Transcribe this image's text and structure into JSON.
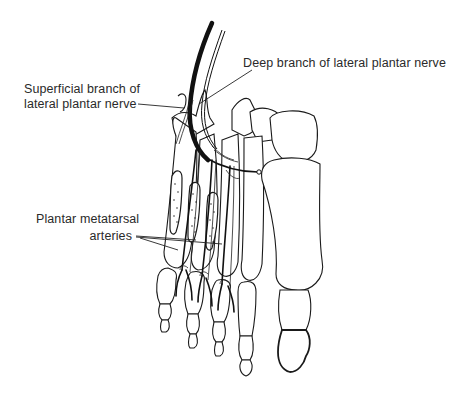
{
  "figure": {
    "background": "#ffffff",
    "line_color": "#1a1a1a"
  },
  "labels": {
    "deep_branch": "Deep branch of lateral plantar nerve",
    "superficial_branch_line1": "Superficial branch of",
    "superficial_branch_line2": "lateral plantar nerve",
    "plantar_metatarsal_line1": "Plantar metatarsal",
    "plantar_metatarsal_line2": "arteries"
  }
}
